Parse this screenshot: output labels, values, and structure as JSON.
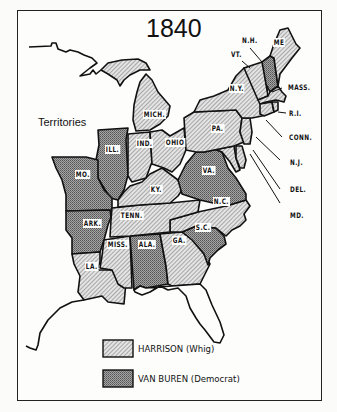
{
  "map": {
    "title": "1840",
    "territories_label": "Territories",
    "colors": {
      "harrison_fill": "#d9d9d9",
      "harrison_hatch": "#6a6a6a",
      "vanburen_fill": "#8f8f8f",
      "vanburen_dot": "#5a5a5a",
      "border": "#111111",
      "background": "#fdfdfc"
    },
    "states": [
      {
        "abbr": "ME",
        "label": "ME",
        "winner": "Harrison"
      },
      {
        "abbr": "NH",
        "label": "N.H.",
        "winner": "Van Buren"
      },
      {
        "abbr": "VT",
        "label": "VT.",
        "winner": "Harrison"
      },
      {
        "abbr": "NY",
        "label": "N.Y.",
        "winner": "Harrison"
      },
      {
        "abbr": "MA",
        "label": "MASS.",
        "winner": "Harrison"
      },
      {
        "abbr": "RI",
        "label": "R.I.",
        "winner": "Harrison"
      },
      {
        "abbr": "CT",
        "label": "CONN.",
        "winner": "Harrison"
      },
      {
        "abbr": "NJ",
        "label": "N.J.",
        "winner": "Harrison"
      },
      {
        "abbr": "DE",
        "label": "DEL.",
        "winner": "Harrison"
      },
      {
        "abbr": "MD",
        "label": "MD.",
        "winner": "Harrison"
      },
      {
        "abbr": "PA",
        "label": "PA.",
        "winner": "Harrison"
      },
      {
        "abbr": "MI",
        "label": "MICH.",
        "winner": "Harrison"
      },
      {
        "abbr": "OH",
        "label": "OHIO",
        "winner": "Harrison"
      },
      {
        "abbr": "IN",
        "label": "IND.",
        "winner": "Harrison"
      },
      {
        "abbr": "IL",
        "label": "ILL.",
        "winner": "Van Buren"
      },
      {
        "abbr": "MO",
        "label": "MO.",
        "winner": "Van Buren"
      },
      {
        "abbr": "KY",
        "label": "KY.",
        "winner": "Harrison"
      },
      {
        "abbr": "VA",
        "label": "VA.",
        "winner": "Van Buren"
      },
      {
        "abbr": "NC",
        "label": "N.C.",
        "winner": "Harrison"
      },
      {
        "abbr": "TN",
        "label": "TENN.",
        "winner": "Harrison"
      },
      {
        "abbr": "AR",
        "label": "ARK.",
        "winner": "Van Buren"
      },
      {
        "abbr": "SC",
        "label": "S.C.",
        "winner": "Van Buren"
      },
      {
        "abbr": "GA",
        "label": "GA.",
        "winner": "Harrison"
      },
      {
        "abbr": "AL",
        "label": "ALA.",
        "winner": "Van Buren"
      },
      {
        "abbr": "MS",
        "label": "MISS.",
        "winner": "Harrison"
      },
      {
        "abbr": "LA",
        "label": "LA.",
        "winner": "Harrison"
      }
    ]
  },
  "legend": {
    "items": [
      {
        "label": "HARRISON (Whig)",
        "pattern": "hatched"
      },
      {
        "label": "VAN BUREN (Democrat)",
        "pattern": "dotted"
      }
    ]
  }
}
